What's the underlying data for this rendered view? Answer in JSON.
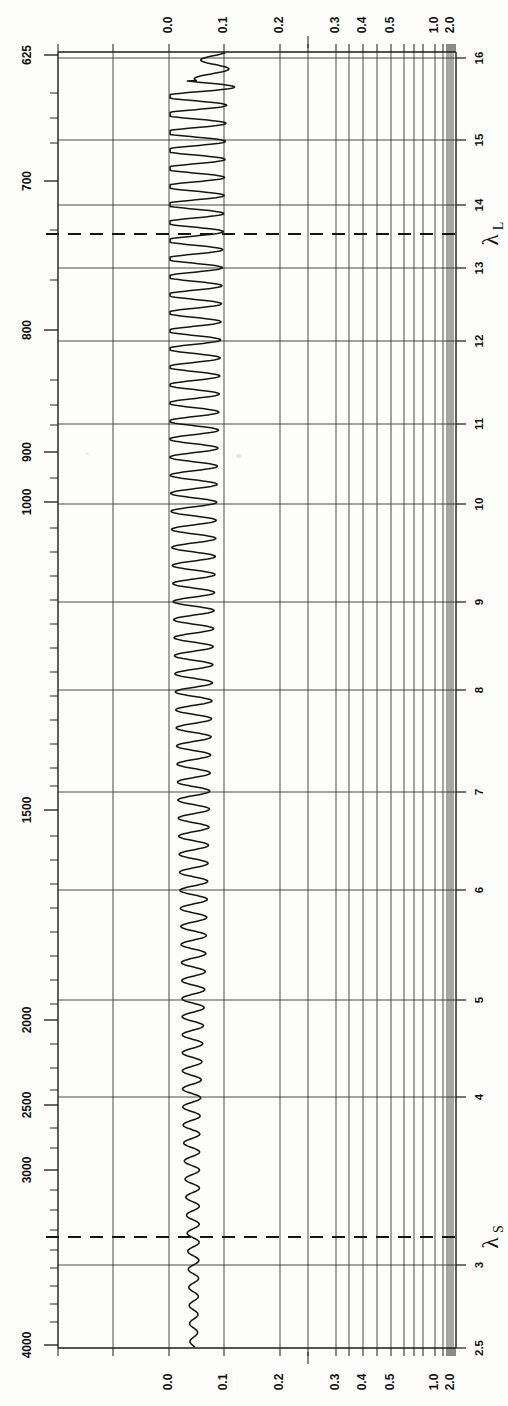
{
  "meta": {
    "figure_kind": "infrared-absorbance-spectrum",
    "orientation": "rotated-90-ccw",
    "background": "#fdfdfb",
    "ink": "#111111"
  },
  "markers": [
    {
      "name": "lambda-L",
      "symbol": "λ",
      "subscript": "L",
      "micron": 13.4,
      "y": 234
    },
    {
      "name": "lambda-S",
      "symbol": "λ",
      "subscript": "S",
      "micron": 3.05,
      "y": 1237
    }
  ],
  "chart_data": {
    "type": "line",
    "title": "",
    "xlabel": "Absorbance",
    "ylabel": "Wavenumber (cm-1) / Wavelength (microns)",
    "grid": true,
    "legend_position": "none",
    "absorbance_axis": {
      "name": "absorbance",
      "position": "top-and-bottom",
      "scale": "logarithmic-transmittance",
      "labels": [
        "0.0",
        "0.1",
        "0.2",
        "0.3",
        "0.4",
        "0.5",
        "1.0",
        "2.0"
      ],
      "values": [
        0.0,
        0.1,
        0.2,
        0.3,
        0.4,
        0.5,
        1.0,
        2.0
      ],
      "tick_x": [
        169,
        224,
        280,
        336,
        363,
        391,
        435,
        451
      ],
      "minor_tick_x": [
        58,
        113,
        308,
        349,
        377,
        404,
        414,
        423,
        443,
        447,
        455
      ],
      "range": [
        0.0,
        2.0
      ]
    },
    "wavenumber_axis": {
      "name": "wavenumber",
      "units": "cm-1",
      "position": "left",
      "labels": [
        "625",
        "700",
        "800",
        "900",
        "1000",
        "1500",
        "2000",
        "2500",
        "3000",
        "4000"
      ],
      "values": [
        625,
        700,
        800,
        900,
        1000,
        1500,
        2000,
        2500,
        3000,
        4000
      ],
      "label_y": [
        55,
        181,
        330,
        452,
        502,
        810,
        1020,
        1105,
        1170,
        1345
      ],
      "range": [
        625,
        4000
      ]
    },
    "wavelength_axis": {
      "name": "wavelength-microns",
      "units": "microns",
      "position": "right",
      "labels": [
        "16",
        "15",
        "14",
        "13",
        "12",
        "11",
        "10",
        "9",
        "8",
        "7",
        "6",
        "5",
        "4",
        "3",
        "2.5"
      ],
      "values": [
        16,
        15,
        14,
        13,
        12,
        11,
        10,
        9,
        8,
        7,
        6,
        5,
        4,
        3,
        2.5
      ],
      "label_y": [
        58,
        140,
        205,
        268,
        341,
        424,
        504,
        602,
        690,
        792,
        890,
        1000,
        1097,
        1265,
        1348
      ],
      "range": [
        2.5,
        16
      ]
    },
    "series": [
      {
        "name": "interference-fringe-trace",
        "description": "Transmission trace of a thin film showing channel-spectrum interference fringes; fringe spacing widens toward long wavelength (top) and collapses toward 4000 cm-1 (bottom).",
        "baseline_absorbance": 0.045,
        "amplitude_top": 0.055,
        "amplitude_bottom": 0.012
      }
    ]
  }
}
